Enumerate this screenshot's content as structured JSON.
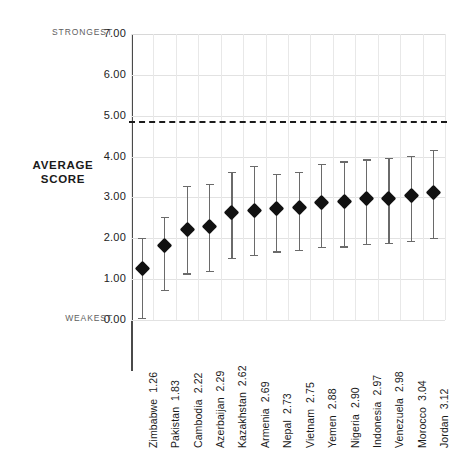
{
  "chart_data": {
    "type": "scatter",
    "title": "",
    "xlabel": "",
    "ylabel": "AVERAGE SCORE",
    "ylim": [
      0,
      7
    ],
    "ytick_labels": [
      "7.00",
      "6.00",
      "5.00",
      "4.00",
      "3.00",
      "2.00",
      "1.00",
      "0.00"
    ],
    "ytick_values": [
      7,
      6,
      5,
      4,
      3,
      2,
      1,
      0
    ],
    "grid": true,
    "legend": false,
    "axis_top_annotation": "STRONGEST",
    "axis_bottom_annotation": "WEAKEST",
    "reference_line": {
      "value": 4.87,
      "style": "dashed",
      "color": "#1a1a1a"
    },
    "marker_shape": "diamond",
    "marker_color": "#111111",
    "error_bar_color": "#6a6a6a",
    "categories": [
      "Zimbabwe",
      "Pakistan",
      "Cambodia",
      "Azerbaijan",
      "Kazakhstan",
      "Armenia",
      "Nepal",
      "Vietnam",
      "Yemen",
      "Nigeria",
      "Indonesia",
      "Venezuela",
      "Morocco",
      "Jordan"
    ],
    "values": [
      1.26,
      1.83,
      2.22,
      2.29,
      2.62,
      2.69,
      2.73,
      2.75,
      2.88,
      2.9,
      2.97,
      2.98,
      3.04,
      3.12
    ],
    "error_low": [
      0.05,
      0.74,
      1.14,
      1.21,
      1.52,
      1.6,
      1.68,
      1.72,
      1.78,
      1.8,
      1.86,
      1.88,
      1.93,
      2.0
    ],
    "error_high": [
      2.0,
      2.53,
      3.28,
      3.33,
      3.62,
      3.78,
      3.57,
      3.62,
      3.82,
      3.88,
      3.93,
      3.96,
      4.02,
      4.16
    ]
  },
  "axis_labels": {
    "strongest": "STRONGEST",
    "weakest": "WEAKEST",
    "average_line1": "AVERAGE",
    "average_line2": "SCORE"
  }
}
